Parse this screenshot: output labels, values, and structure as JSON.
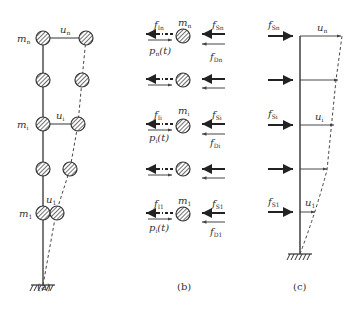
{
  "figure": {
    "panels": [
      {
        "id": "a",
        "caption": "(a)",
        "labels": {
          "mass_top": {
            "base": "m",
            "sub": "n"
          },
          "mass_mid": {
            "base": "m",
            "sub": "i"
          },
          "mass_bottom": {
            "base": "m",
            "sub": "1"
          },
          "disp_top": {
            "base": "u",
            "sub": "n"
          },
          "disp_mid": {
            "base": "u",
            "sub": "i"
          },
          "disp_bottom": {
            "base": "u",
            "sub": "1"
          }
        }
      },
      {
        "id": "b",
        "caption": "(b)",
        "labels": {
          "top": {
            "inertia": {
              "base": "f",
              "sub": "In"
            },
            "mass": {
              "base": "m",
              "sub": "n"
            },
            "spring": {
              "base": "f",
              "sub": "Sn"
            },
            "load": {
              "base": "p",
              "sub": "n",
              "tail": "(t)"
            },
            "damping": {
              "base": "f",
              "sub": "Dn"
            }
          },
          "mid": {
            "inertia": {
              "base": "f",
              "sub": "Ii"
            },
            "mass": {
              "base": "m",
              "sub": "i"
            },
            "spring": {
              "base": "f",
              "sub": "Si"
            },
            "load": {
              "base": "p",
              "sub": "i",
              "tail": "(t)"
            },
            "damping": {
              "base": "f",
              "sub": "Di"
            }
          },
          "bottom": {
            "inertia": {
              "base": "f",
              "sub": "I1"
            },
            "mass": {
              "base": "m",
              "sub": "1"
            },
            "spring": {
              "base": "f",
              "sub": "S1"
            },
            "load": {
              "base": "p",
              "sub": "i",
              "tail": "(t)"
            },
            "damping": {
              "base": "f",
              "sub": "D1"
            }
          }
        }
      },
      {
        "id": "c",
        "caption": "(c)",
        "labels": {
          "force_top": {
            "base": "f",
            "sub": "Sn"
          },
          "force_mid": {
            "base": "f",
            "sub": "Si"
          },
          "force_bottom": {
            "base": "f",
            "sub": "S1"
          },
          "disp_top": {
            "base": "u",
            "sub": "n"
          },
          "disp_mid": {
            "base": "u",
            "sub": "i"
          },
          "disp_bottom": {
            "base": "u",
            "sub": "1"
          }
        }
      }
    ]
  }
}
